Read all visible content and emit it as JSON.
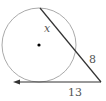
{
  "diagram": {
    "type": "circle-secant-tangent",
    "circle": {
      "cx": 39,
      "cy": 45,
      "r": 37,
      "stroke": "#aaaaaa",
      "center_dot": true
    },
    "secant": {
      "from": [
        40,
        8
      ],
      "to": [
        101,
        82
      ],
      "stroke": "#333333"
    },
    "tangent": {
      "from": [
        101,
        82
      ],
      "to": [
        14,
        82
      ],
      "stroke": "#333333",
      "arrow": "left"
    },
    "labels": {
      "chord": "x",
      "external_segment": "8",
      "tangent_length": "13"
    }
  }
}
